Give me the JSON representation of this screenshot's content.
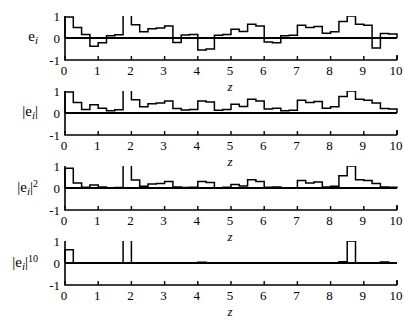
{
  "figure": {
    "width": 404,
    "height": 310,
    "background": "#ffffff",
    "line_color": "#000000",
    "bar_fill": "#ffffff",
    "xaxis_title": "z"
  },
  "axis": {
    "x_ticks": [
      "0",
      "1",
      "2",
      "3",
      "4",
      "5",
      "6",
      "7",
      "8",
      "9",
      "10"
    ],
    "y_ticks": [
      "1",
      "0",
      "-1"
    ],
    "xlim": [
      0,
      10
    ],
    "ylim": [
      -1,
      1
    ],
    "grid": false
  },
  "panels": [
    {
      "id": "panel-ei",
      "ylabel_main": "e",
      "ylabel_sub": "i",
      "ylabel_sup": "",
      "ylabel_bars": false
    },
    {
      "id": "panel-abs-ei",
      "ylabel_main": "e",
      "ylabel_sub": "i",
      "ylabel_sup": "",
      "ylabel_bars": true
    },
    {
      "id": "panel-abs-ei-sq",
      "ylabel_main": "e",
      "ylabel_sub": "i",
      "ylabel_sup": "2",
      "ylabel_bars": true
    },
    {
      "id": "panel-abs-ei-10",
      "ylabel_main": "e",
      "ylabel_sub": "i",
      "ylabel_sup": "10",
      "ylabel_bars": true
    }
  ],
  "chart_data": [
    {
      "type": "bar",
      "title": "",
      "subtitle": "",
      "xlabel": "z",
      "ylabel": "e_i",
      "xlim": [
        0,
        10
      ],
      "ylim": [
        -1,
        1
      ],
      "grid": false,
      "legend": "none",
      "bin_width": 0.25,
      "x": [
        0.0,
        0.25,
        0.5,
        0.75,
        1.0,
        1.25,
        1.5,
        1.75,
        2.0,
        2.25,
        2.5,
        2.75,
        3.0,
        3.25,
        3.5,
        3.75,
        4.0,
        4.25,
        4.5,
        4.75,
        5.0,
        5.25,
        5.5,
        5.75,
        6.0,
        6.25,
        6.5,
        6.75,
        7.0,
        7.25,
        7.5,
        7.75,
        8.0,
        8.25,
        8.5,
        8.75,
        9.0,
        9.25,
        9.5,
        9.75
      ],
      "values": [
        0.95,
        0.48,
        0.16,
        -0.38,
        -0.22,
        0.1,
        0.15,
        1.05,
        0.6,
        0.28,
        0.42,
        0.45,
        0.55,
        -0.2,
        0.14,
        0.16,
        -0.55,
        -0.5,
        0.12,
        0.16,
        0.4,
        0.3,
        0.62,
        0.55,
        -0.18,
        -0.22,
        0.1,
        0.12,
        0.58,
        0.48,
        0.52,
        0.22,
        0.28,
        0.75,
        1.0,
        0.62,
        0.58,
        -0.45,
        0.2,
        0.18
      ]
    },
    {
      "type": "bar",
      "title": "",
      "subtitle": "",
      "xlabel": "z",
      "ylabel": "|e_i|",
      "xlim": [
        0,
        10
      ],
      "ylim": [
        -1,
        1
      ],
      "grid": false,
      "legend": "none",
      "bin_width": 0.25,
      "x": [
        0.0,
        0.25,
        0.5,
        0.75,
        1.0,
        1.25,
        1.5,
        1.75,
        2.0,
        2.25,
        2.5,
        2.75,
        3.0,
        3.25,
        3.5,
        3.75,
        4.0,
        4.25,
        4.5,
        4.75,
        5.0,
        5.25,
        5.5,
        5.75,
        6.0,
        6.25,
        6.5,
        6.75,
        7.0,
        7.25,
        7.5,
        7.75,
        8.0,
        8.25,
        8.5,
        8.75,
        9.0,
        9.25,
        9.5,
        9.75
      ],
      "values": [
        0.95,
        0.48,
        0.16,
        0.38,
        0.22,
        0.1,
        0.15,
        1.05,
        0.6,
        0.28,
        0.42,
        0.45,
        0.55,
        0.2,
        0.14,
        0.16,
        0.55,
        0.5,
        0.12,
        0.16,
        0.4,
        0.3,
        0.62,
        0.55,
        0.18,
        0.22,
        0.1,
        0.12,
        0.58,
        0.48,
        0.52,
        0.22,
        0.28,
        0.75,
        1.0,
        0.62,
        0.58,
        0.45,
        0.2,
        0.18
      ]
    },
    {
      "type": "bar",
      "title": "",
      "subtitle": "",
      "xlabel": "z",
      "ylabel": "|e_i|^2",
      "xlim": [
        0,
        10
      ],
      "ylim": [
        -1,
        1
      ],
      "grid": false,
      "legend": "none",
      "bin_width": 0.25,
      "x": [
        0.0,
        0.25,
        0.5,
        0.75,
        1.0,
        1.25,
        1.5,
        1.75,
        2.0,
        2.25,
        2.5,
        2.75,
        3.0,
        3.25,
        3.5,
        3.75,
        4.0,
        4.25,
        4.5,
        4.75,
        5.0,
        5.25,
        5.5,
        5.75,
        6.0,
        6.25,
        6.5,
        6.75,
        7.0,
        7.25,
        7.5,
        7.75,
        8.0,
        8.25,
        8.5,
        8.75,
        9.0,
        9.25,
        9.5,
        9.75
      ],
      "values": [
        0.9,
        0.23,
        0.03,
        0.14,
        0.05,
        0.01,
        0.02,
        1.1,
        0.36,
        0.08,
        0.18,
        0.2,
        0.3,
        0.04,
        0.02,
        0.03,
        0.3,
        0.25,
        0.01,
        0.03,
        0.16,
        0.09,
        0.38,
        0.3,
        0.03,
        0.05,
        0.01,
        0.01,
        0.34,
        0.23,
        0.27,
        0.05,
        0.08,
        0.56,
        1.0,
        0.38,
        0.34,
        0.2,
        0.04,
        0.03
      ]
    },
    {
      "type": "bar",
      "title": "",
      "subtitle": "",
      "xlabel": "z",
      "ylabel": "|e_i|^10",
      "xlim": [
        0,
        10
      ],
      "ylim": [
        -1,
        1
      ],
      "grid": false,
      "legend": "none",
      "bin_width": 0.25,
      "x": [
        0.0,
        0.25,
        0.5,
        0.75,
        1.0,
        1.25,
        1.5,
        1.75,
        2.0,
        2.25,
        2.5,
        2.75,
        3.0,
        3.25,
        3.5,
        3.75,
        4.0,
        4.25,
        4.5,
        4.75,
        5.0,
        5.25,
        5.5,
        5.75,
        6.0,
        6.25,
        6.5,
        6.75,
        7.0,
        7.25,
        7.5,
        7.75,
        8.0,
        8.25,
        8.5,
        8.75,
        9.0,
        9.25,
        9.5,
        9.75
      ],
      "values": [
        0.6,
        0.0,
        0.0,
        0.0,
        0.0,
        0.0,
        0.0,
        1.63,
        0.01,
        0.0,
        0.0,
        0.0,
        0.0,
        0.0,
        0.0,
        0.0,
        0.03,
        0.01,
        0.0,
        0.0,
        0.0,
        0.0,
        0.01,
        0.0,
        0.0,
        0.0,
        0.0,
        0.0,
        0.0,
        0.0,
        0.0,
        0.0,
        0.0,
        0.06,
        1.0,
        0.01,
        0.0,
        0.0,
        0.05,
        0.0
      ]
    }
  ]
}
